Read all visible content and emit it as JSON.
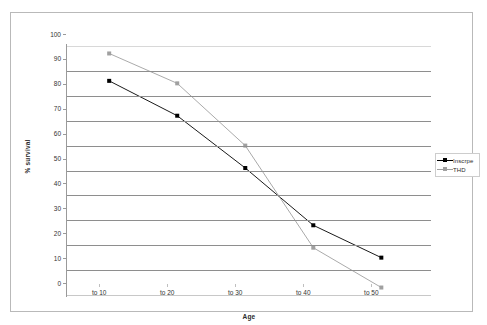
{
  "chart_data": {
    "type": "line",
    "title": "",
    "xlabel": "Age",
    "ylabel": "% survival",
    "categories": [
      "to 10",
      "to 20",
      "to 30",
      "to 40",
      "to 50"
    ],
    "ylim": [
      0,
      100
    ],
    "yticks": [
      0,
      10,
      20,
      30,
      40,
      50,
      60,
      70,
      80,
      90,
      100
    ],
    "grid": true,
    "legend_position": "right",
    "series": [
      {
        "name": "Inscrpe",
        "color": "#000000",
        "marker": "square",
        "values": [
          86,
          72,
          51,
          28,
          15
        ]
      },
      {
        "name": "THD",
        "color": "#a0a0a0",
        "marker": "square",
        "values": [
          97,
          85,
          60,
          19,
          3
        ]
      }
    ]
  },
  "axes": {
    "y_tick_labels": [
      "100",
      "90",
      "80",
      "70",
      "60",
      "50",
      "40",
      "30",
      "20",
      "10",
      "0"
    ],
    "x_tick_labels": [
      "to 10",
      "to 20",
      "to 30",
      "to 40",
      "to 50"
    ],
    "y_title": "% survival",
    "x_title": "Age"
  },
  "legend": {
    "entries": [
      {
        "label": "Inscrpe",
        "color": "#000000"
      },
      {
        "label": "THD",
        "color": "#a0a0a0"
      }
    ]
  },
  "colors": {
    "series_1": "#000000",
    "series_2": "#a0a0a0",
    "gridline": "#8e8e8e",
    "frame": "#b9b9b9",
    "background": "#ffffff"
  }
}
